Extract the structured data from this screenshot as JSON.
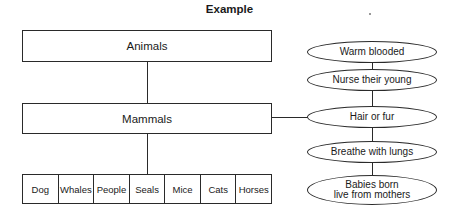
{
  "title": "Example",
  "hierarchy": {
    "top": "Animals",
    "middle": "Mammals",
    "examples": [
      "Dog",
      "Whales",
      "People",
      "Seals",
      "Mice",
      "Cats",
      "Horses"
    ]
  },
  "characteristics": {
    "items": [
      "Warm blooded",
      "Nurse their young",
      "Hair or fur",
      "Breathe with lungs",
      "Babies born live from mothers"
    ],
    "last_line1": "Babies born",
    "last_line2": "live from mothers"
  },
  "colors": {
    "line": "#2a2a2a",
    "background": "#ffffff"
  }
}
